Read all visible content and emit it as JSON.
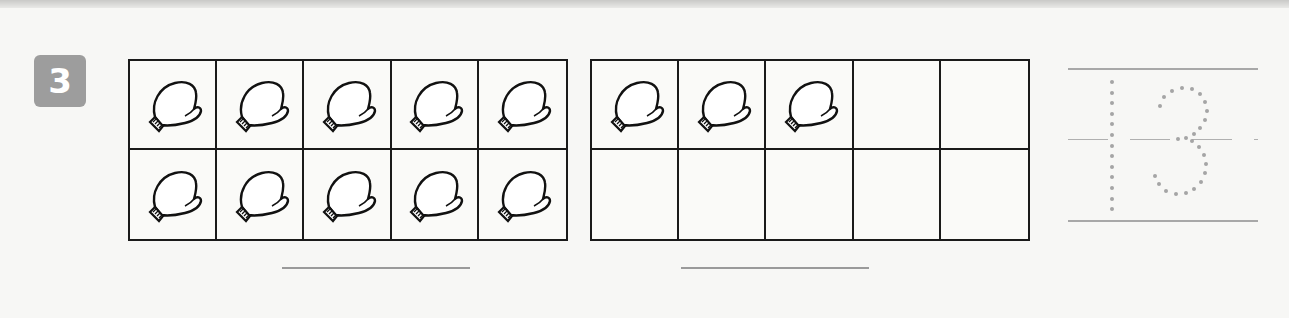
{
  "exercise": {
    "number": "3",
    "badge_color": "#9d9d9d"
  },
  "ten_frames": [
    {
      "id": "frame-1",
      "filled_count": 10,
      "cells": [
        "mitten",
        "mitten",
        "mitten",
        "mitten",
        "mitten",
        "mitten",
        "mitten",
        "mitten",
        "mitten",
        "mitten"
      ]
    },
    {
      "id": "frame-2",
      "filled_count": 3,
      "cells": [
        "mitten",
        "mitten",
        "mitten",
        "empty",
        "empty",
        "empty",
        "empty",
        "empty",
        "empty",
        "empty"
      ]
    }
  ],
  "answer_lines": [
    {
      "label": "",
      "value": ""
    },
    {
      "label": "",
      "value": ""
    }
  ],
  "tracing": {
    "number": "13",
    "style": "dotted"
  },
  "icons": {
    "cell_item": "mitten-icon"
  }
}
